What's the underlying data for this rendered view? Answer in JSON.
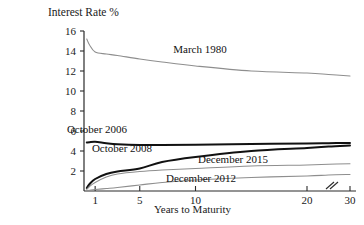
{
  "chart_data": {
    "type": "line",
    "title": "Interest Rate %",
    "xlabel": "Years to Maturity",
    "ylabel": "Interest Rate %",
    "xlim": [
      0,
      30
    ],
    "ylim": [
      0,
      16
    ],
    "grid": false,
    "legend_position": "inline-annotations",
    "x_ticks": [
      "1",
      "5",
      "10",
      "20",
      "30"
    ],
    "x_tick_values": [
      1,
      5,
      10,
      20,
      30
    ],
    "y_ticks": [
      "2",
      "4",
      "6",
      "8",
      "10",
      "12",
      "14",
      "16"
    ],
    "y_tick_values": [
      2,
      4,
      6,
      8,
      10,
      12,
      14,
      16
    ],
    "axis_break": {
      "between": [
        20,
        30
      ],
      "symbol": "//"
    },
    "series": [
      {
        "name": "March 1980",
        "color": "#8e8e8e",
        "width": "thin",
        "x": [
          0.25,
          0.5,
          1,
          2,
          3,
          5,
          7,
          10,
          15,
          20,
          25,
          30
        ],
        "values": [
          15.2,
          14.6,
          13.9,
          13.7,
          13.55,
          13.2,
          12.9,
          12.5,
          12.0,
          11.8,
          11.65,
          11.5
        ]
      },
      {
        "name": "October 2006",
        "color": "#111111",
        "width": "thick",
        "x": [
          0.25,
          0.5,
          1,
          2,
          3,
          5,
          7,
          10,
          15,
          20,
          25,
          30
        ],
        "values": [
          4.85,
          4.88,
          4.92,
          4.78,
          4.68,
          4.6,
          4.6,
          4.62,
          4.7,
          4.75,
          4.78,
          4.8
        ]
      },
      {
        "name": "October 2008",
        "color": "#111111",
        "width": "thick",
        "x": [
          0.25,
          0.5,
          1,
          2,
          3,
          5,
          7,
          10,
          15,
          20,
          25,
          30
        ],
        "values": [
          0.3,
          0.7,
          1.2,
          1.7,
          1.95,
          2.25,
          2.9,
          3.4,
          4.0,
          4.3,
          4.45,
          4.55
        ]
      },
      {
        "name": "December 2015",
        "color": "#8e8e8e",
        "width": "thin",
        "x": [
          0.25,
          0.5,
          1,
          2,
          3,
          5,
          7,
          10,
          15,
          20,
          25,
          30
        ],
        "values": [
          0.15,
          0.45,
          0.85,
          1.4,
          1.7,
          1.95,
          2.1,
          2.25,
          2.5,
          2.6,
          2.68,
          2.72
        ]
      },
      {
        "name": "December 2012",
        "color": "#8e8e8e",
        "width": "thin",
        "x": [
          0.25,
          0.5,
          1,
          2,
          3,
          5,
          7,
          10,
          15,
          20,
          25,
          30
        ],
        "values": [
          0.05,
          0.08,
          0.15,
          0.25,
          0.35,
          0.6,
          0.85,
          1.1,
          1.35,
          1.5,
          1.6,
          1.65
        ]
      }
    ],
    "annotations": [
      {
        "text": "March 1980",
        "x_px": 200,
        "y_px": 53
      },
      {
        "text": "October 2006",
        "x_px": 97,
        "y_px": 133
      },
      {
        "text": "October 2008",
        "x_px": 122,
        "y_px": 152
      },
      {
        "text": "December 2015",
        "x_px": 233,
        "y_px": 163
      },
      {
        "text": "December 2012",
        "x_px": 201,
        "y_px": 182
      }
    ]
  }
}
